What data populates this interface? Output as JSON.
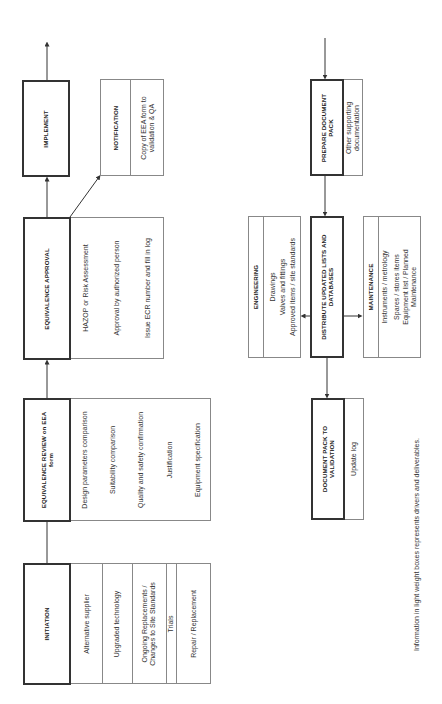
{
  "flow": {
    "initiation": {
      "title": "INITIATION",
      "drivers": [
        "Alternative supplier",
        "Upgraded technology",
        "Ongoing Replacements /\nChanges to Site Standards",
        "Trials",
        "Repair / Replacement"
      ]
    },
    "review": {
      "title": "EQUIVALENCE REVIEW on EEA\nform",
      "items": [
        "Design parameters comparison",
        "Suitability comparison",
        "Quality and safety confirmation",
        "Justification",
        "Equipment specification"
      ]
    },
    "approval": {
      "title": "EQUIVALENCE APPROVAL",
      "items": [
        "HAZOP or Risk Assessment",
        "Approval by authorized person",
        "Issue ECR number and fill in log"
      ]
    },
    "notification": {
      "title": "NOTIFICATION",
      "text": "Copy of EEA form to\nvalidation & QA"
    },
    "implement": {
      "title": "IMPLEMENT"
    },
    "prepare_pack": {
      "title": "PREPARE DOCUMENT\nPACK",
      "text": "Other supporting\ndocumentation"
    },
    "distribute": {
      "title": "DISTRIBUTE UPDATED LISTS AND\nDATABASES"
    },
    "engineering": {
      "title": "ENGINEERING",
      "items": [
        "Drawings",
        "Valves and fittings",
        "Approved items / site standards"
      ]
    },
    "maintenance": {
      "title": "MAINTENANCE",
      "items": [
        "Instruments / metrology",
        "Spares / stores items",
        "Equipment list / Planned\nMaintenance"
      ]
    },
    "validation": {
      "title": "DOCUMENT PACK TO\nVALIDATION",
      "text": "Update log"
    }
  },
  "footnote": "Information in light weight boxes represents drivers and deliverables.",
  "colors": {
    "bold_border": "#333333",
    "light_border": "#888888",
    "line": "#333333"
  }
}
